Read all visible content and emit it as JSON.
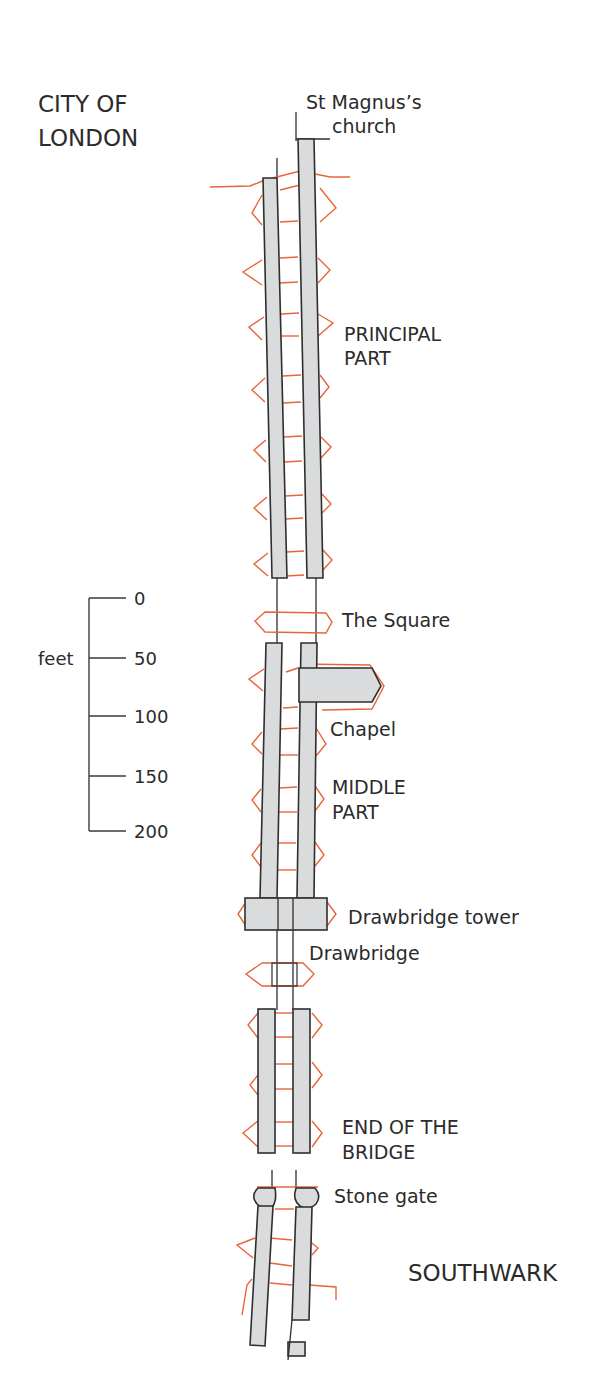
{
  "title_regions": {
    "north": "CITY OF\nLONDON",
    "north_line1": "CITY OF",
    "north_line2": "LONDON",
    "south": "SOUTHWARK"
  },
  "labels": {
    "church_line1": "St Magnus’s",
    "church_line2": "church",
    "principal_line1": "PRINCIPAL",
    "principal_line2": "PART",
    "square": "The Square",
    "chapel": "Chapel",
    "middle_line1": "MIDDLE",
    "middle_line2": "PART",
    "drawbridge_tower": "Drawbridge tower",
    "drawbridge": "Drawbridge",
    "end_line1": "END OF THE",
    "end_line2": "BRIDGE",
    "stone_gate": "Stone gate"
  },
  "scale_bar": {
    "unit": "feet",
    "ticks": [
      "0",
      "50",
      "100",
      "150",
      "200"
    ]
  },
  "colors": {
    "pier_fill": "#d9dbdd",
    "outline": "#2e2e2e",
    "arch": "#e8643a",
    "text": "#2b2b2b"
  }
}
